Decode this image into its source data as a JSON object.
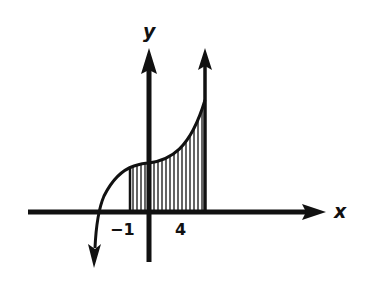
{
  "diagram": {
    "type": "area-under-curve",
    "axes": {
      "x_label": "x",
      "y_label": "y"
    },
    "ticks": {
      "left_bound": "−1",
      "right_bound": "4"
    },
    "shaded_interval": [
      -1,
      4
    ],
    "colors": {
      "ink": "#111111",
      "background": "#ffffff"
    }
  }
}
